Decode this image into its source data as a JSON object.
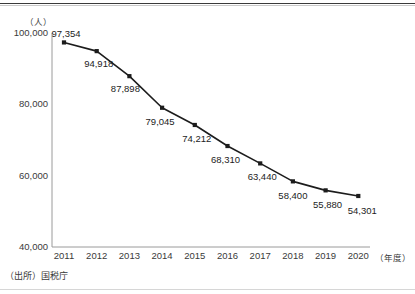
{
  "figure": {
    "source_note": "（出所）国税庁",
    "clipped_header_text": "．．．　．．　．．．　　．．．"
  },
  "chart_data": {
    "type": "line",
    "title": "",
    "subtitle": "",
    "xlabel": "（年度）",
    "ylabel": "（人）",
    "categories": [
      "2011",
      "2012",
      "2013",
      "2014",
      "2015",
      "2016",
      "2017",
      "2018",
      "2019",
      "2020"
    ],
    "values": [
      97354,
      94918,
      87898,
      79045,
      74212,
      68310,
      63440,
      58400,
      55880,
      54301
    ],
    "value_labels": [
      "97,354",
      "94,918",
      "87,898",
      "79,045",
      "74,212",
      "68,310",
      "63,440",
      "58,400",
      "55,880",
      "54,301"
    ],
    "ylim": [
      40000,
      100000
    ],
    "y_ticks": [
      40000,
      60000,
      80000,
      100000
    ],
    "y_tick_labels": [
      "40,000",
      "60,000",
      "80,000",
      "100,000"
    ],
    "grid": false,
    "legend": "none",
    "series": [
      {
        "name": "人数",
        "values": [
          97354,
          94918,
          87898,
          79045,
          74212,
          68310,
          63440,
          58400,
          55880,
          54301
        ],
        "line_color": "#1c1c1c",
        "marker": "square",
        "marker_color": "#1c1c1c"
      }
    ],
    "colors": {
      "line": "#1c1c1c",
      "marker": "#1c1c1c",
      "axis": "#9a9a9a",
      "text": "#3a3a3a",
      "background": "#ffffff"
    }
  }
}
